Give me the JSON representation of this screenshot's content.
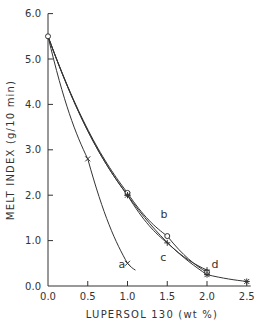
{
  "chart_data": {
    "type": "line",
    "title": "",
    "xlabel": "LUPERSOL 130 (wt %)",
    "ylabel": "MELT INDEX (g/10 min)",
    "xlim": [
      0.0,
      2.5
    ],
    "ylim": [
      0.0,
      6.0
    ],
    "x_ticks": [
      "0.0",
      "0.5",
      "1.0",
      "1.5",
      "2.0",
      "2.5"
    ],
    "y_ticks": [
      "0.0",
      "1.0",
      "2.0",
      "3.0",
      "4.0",
      "5.0",
      "6.0"
    ],
    "grid": false,
    "legend": "inline curve labels a, b, c, d",
    "series": [
      {
        "name": "a",
        "marker": "x",
        "x": [
          0.0,
          0.5,
          1.0
        ],
        "y": [
          5.5,
          2.8,
          0.5
        ],
        "curve_end": [
          1.1,
          0.35
        ]
      },
      {
        "name": "b",
        "marker": "o",
        "x": [
          0.0,
          1.0,
          1.5,
          2.0
        ],
        "y": [
          5.5,
          2.05,
          1.1,
          0.3
        ]
      },
      {
        "name": "c",
        "marker": "+",
        "x": [
          0.0,
          1.0,
          1.5,
          2.0
        ],
        "y": [
          5.5,
          2.0,
          0.95,
          0.35
        ]
      },
      {
        "name": "d",
        "marker": "*",
        "x": [
          0.0,
          1.0,
          2.0,
          2.5
        ],
        "y": [
          5.5,
          2.0,
          0.25,
          0.1
        ]
      }
    ],
    "annotations": [
      "a",
      "b",
      "c",
      "d"
    ]
  }
}
